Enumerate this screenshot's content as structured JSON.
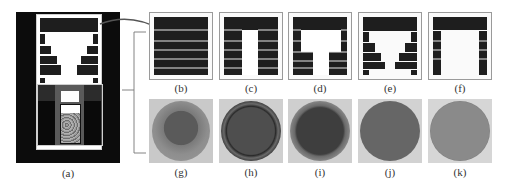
{
  "figure": {
    "labels": {
      "a": "(a)",
      "b": "(b)",
      "c": "(c)",
      "d": "(d)",
      "e": "(e)",
      "f": "(f)",
      "g": "(g)",
      "h": "(h)",
      "i": "(i)",
      "j": "(j)",
      "k": "(k)"
    },
    "colors": {
      "furnace_black": "#0c0c0c",
      "insulation_dark": "#1e1e1e",
      "gap_light": "#e8e8e8",
      "heater_gray": "#5a5a5a",
      "crucible_fill": "#8a8a8a",
      "frame_gray": "#9a9a9a"
    },
    "panels_top": [
      {
        "id": "b",
        "label": "(b)",
        "description": "full stacked insulation, 6 layers"
      },
      {
        "id": "c",
        "label": "(c)",
        "description": "straight central opening"
      },
      {
        "id": "d",
        "label": "(d)",
        "description": "stepped opening, narrow bottom"
      },
      {
        "id": "e",
        "label": "(e)",
        "description": "inverted trapezoid opening"
      },
      {
        "id": "f",
        "label": "(f)",
        "description": "wide opening with thin side walls"
      }
    ],
    "panels_bottom": [
      {
        "id": "g",
        "label": "(g)"
      },
      {
        "id": "h",
        "label": "(h)"
      },
      {
        "id": "i",
        "label": "(i)"
      },
      {
        "id": "j",
        "label": "(j)"
      },
      {
        "id": "k",
        "label": "(k)"
      }
    ]
  }
}
